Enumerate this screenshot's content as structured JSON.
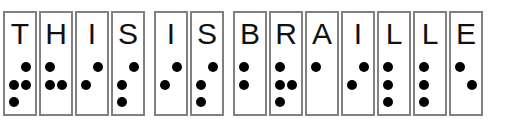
{
  "figure": {
    "name": "braille-alphabet-strip",
    "message": "THIS IS BRAILLE",
    "dot_color": "#000000",
    "cell_border_color": "#808080",
    "letter_color": "#111111",
    "background": "#ffffff"
  },
  "legend": {
    "dot_numbering": [
      "1",
      "4",
      "2",
      "5",
      "3",
      "6"
    ],
    "note": "Each cell shows a printed capital letter above its six-dot Braille pattern. Filled circles are raised dots."
  },
  "words": [
    {
      "text": "THIS",
      "cells": [
        {
          "letter": "T",
          "dots": [
            false,
            true,
            true,
            true,
            true,
            false
          ],
          "dot_numbers": [
            2,
            3,
            4,
            5
          ]
        },
        {
          "letter": "H",
          "dots": [
            true,
            false,
            true,
            true,
            false,
            false
          ],
          "dot_numbers": [
            1,
            2,
            5
          ]
        },
        {
          "letter": "I",
          "dots": [
            false,
            true,
            true,
            false,
            false,
            false
          ],
          "dot_numbers": [
            2,
            4
          ]
        },
        {
          "letter": "S",
          "dots": [
            false,
            true,
            true,
            false,
            true,
            false
          ],
          "dot_numbers": [
            2,
            3,
            4
          ]
        }
      ]
    },
    {
      "text": "IS",
      "cells": [
        {
          "letter": "I",
          "dots": [
            false,
            true,
            true,
            false,
            false,
            false
          ],
          "dot_numbers": [
            2,
            4
          ]
        },
        {
          "letter": "S",
          "dots": [
            false,
            true,
            true,
            false,
            true,
            false
          ],
          "dot_numbers": [
            2,
            3,
            4
          ]
        }
      ]
    },
    {
      "text": "BRAILLE",
      "cells": [
        {
          "letter": "B",
          "dots": [
            true,
            false,
            true,
            false,
            false,
            false
          ],
          "dot_numbers": [
            1,
            2
          ]
        },
        {
          "letter": "R",
          "dots": [
            true,
            false,
            true,
            true,
            true,
            false
          ],
          "dot_numbers": [
            1,
            2,
            3,
            5
          ]
        },
        {
          "letter": "A",
          "dots": [
            true,
            false,
            false,
            false,
            false,
            false
          ],
          "dot_numbers": [
            1
          ]
        },
        {
          "letter": "I",
          "dots": [
            false,
            true,
            true,
            false,
            false,
            false
          ],
          "dot_numbers": [
            2,
            4
          ]
        },
        {
          "letter": "L",
          "dots": [
            true,
            false,
            true,
            false,
            true,
            false
          ],
          "dot_numbers": [
            1,
            2,
            3
          ]
        },
        {
          "letter": "L",
          "dots": [
            true,
            false,
            true,
            false,
            true,
            false
          ],
          "dot_numbers": [
            1,
            2,
            3
          ]
        },
        {
          "letter": "E",
          "dots": [
            true,
            false,
            false,
            true,
            false,
            false
          ],
          "dot_numbers": [
            1,
            5
          ]
        }
      ]
    }
  ]
}
